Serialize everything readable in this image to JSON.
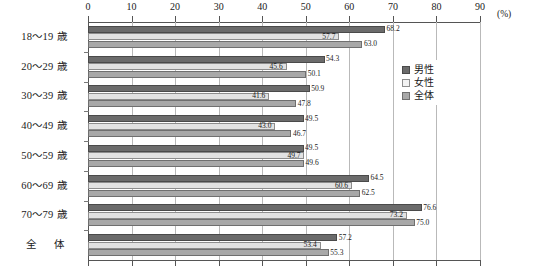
{
  "chart_data": {
    "type": "bar",
    "orientation": "horizontal",
    "title": "",
    "xlabel": "",
    "ylabel": "",
    "unit": "(%)",
    "xlim": [
      0,
      90
    ],
    "xticks": [
      0,
      10,
      20,
      30,
      40,
      50,
      60,
      70,
      80,
      90
    ],
    "grid": true,
    "legend_position": "right",
    "categories": [
      "18～19 歳",
      "20～29 歳",
      "30～39 歳",
      "40～49 歳",
      "50～59 歳",
      "60～69 歳",
      "70～79 歳",
      "全　体"
    ],
    "series": [
      {
        "name": "男性",
        "color": "#6b6b6b",
        "values": [
          68.2,
          54.3,
          50.9,
          49.5,
          49.5,
          64.5,
          76.6,
          57.2
        ]
      },
      {
        "name": "女性",
        "color": "#e2e2e2",
        "values": [
          57.7,
          45.6,
          41.6,
          43.0,
          49.7,
          60.6,
          73.2,
          53.4
        ]
      },
      {
        "name": "全体",
        "color": "#a8a8a8",
        "values": [
          63.0,
          50.1,
          47.8,
          46.7,
          49.6,
          62.5,
          75.0,
          55.3
        ]
      }
    ],
    "value_labels": [
      [
        "68.2",
        "57.7",
        "63.0"
      ],
      [
        "54.3",
        "45.6",
        "50.1"
      ],
      [
        "50.9",
        "41.6",
        "47.8"
      ],
      [
        "49.5",
        "43.0",
        "46.7"
      ],
      [
        "49.5",
        "49.7",
        "49.6"
      ],
      [
        "64.5",
        "60.6",
        "62.5"
      ],
      [
        "76.6",
        "73.2",
        "75.0"
      ],
      [
        "57.2",
        "53.4",
        "55.3"
      ]
    ]
  },
  "legend": {
    "items": [
      {
        "label": "男性",
        "swatch": "male"
      },
      {
        "label": "女性",
        "swatch": "female"
      },
      {
        "label": "全体",
        "swatch": "total"
      }
    ]
  }
}
